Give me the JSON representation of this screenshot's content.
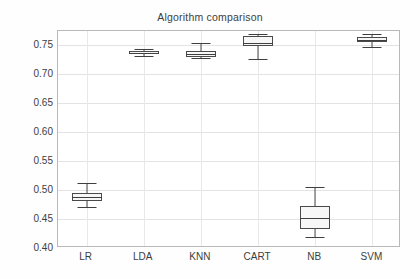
{
  "chart_data": {
    "type": "box",
    "title": "Algorithm comparison",
    "xlabel": "",
    "ylabel": "",
    "categories": [
      "LR",
      "LDA",
      "KNN",
      "CART",
      "NB",
      "SVM"
    ],
    "ylim": [
      0.4,
      0.775
    ],
    "ytick_labels": [
      "0.40",
      "0.45",
      "0.50",
      "0.55",
      "0.60",
      "0.65",
      "0.70",
      "0.75"
    ],
    "ytick_values": [
      0.4,
      0.45,
      0.5,
      0.55,
      0.6,
      0.65,
      0.7,
      0.75
    ],
    "grid": true,
    "legend": "none",
    "boxes": [
      {
        "label": "LR",
        "whisker_low": 0.47,
        "q1": 0.4805,
        "median": 0.488,
        "q3": 0.4945,
        "whisker_high": 0.5115
      },
      {
        "label": "LDA",
        "whisker_low": 0.731,
        "q1": 0.7355,
        "median": 0.7375,
        "q3": 0.7405,
        "whisker_high": 0.7435
      },
      {
        "label": "KNN",
        "whisker_low": 0.728,
        "q1": 0.7305,
        "median": 0.7345,
        "q3": 0.74,
        "whisker_high": 0.755
      },
      {
        "label": "CART",
        "whisker_low": 0.727,
        "q1": 0.7495,
        "median": 0.7545,
        "q3": 0.7655,
        "whisker_high": 0.77
      },
      {
        "label": "NB",
        "whisker_low": 0.419,
        "q1": 0.433,
        "median": 0.451,
        "q3": 0.472,
        "whisker_high": 0.5055
      },
      {
        "label": "SVM",
        "whisker_low": 0.748,
        "q1": 0.7555,
        "median": 0.7595,
        "q3": 0.7645,
        "whisker_high": 0.769
      }
    ],
    "colors": {
      "box_edge": "#4a4a4a",
      "box_fill": "#f7f7f7",
      "median": "#3f3f3f",
      "whisker": "#4a4a4a",
      "grid": "#e3e3e3",
      "frame": "#b9b9b9",
      "text": "#3d3d3d",
      "background": "#ffffff"
    }
  }
}
